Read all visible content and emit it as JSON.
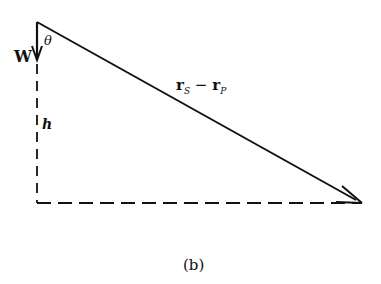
{
  "diagram": {
    "caption": "(b)",
    "labels": {
      "angle": "θ",
      "weight": "W",
      "height": "h",
      "vector_main": "r",
      "vector_sub_s": "S",
      "minus": "−",
      "vector_sub_p": "P"
    },
    "colors": {
      "stroke": "#111111",
      "background": "#ffffff"
    }
  }
}
